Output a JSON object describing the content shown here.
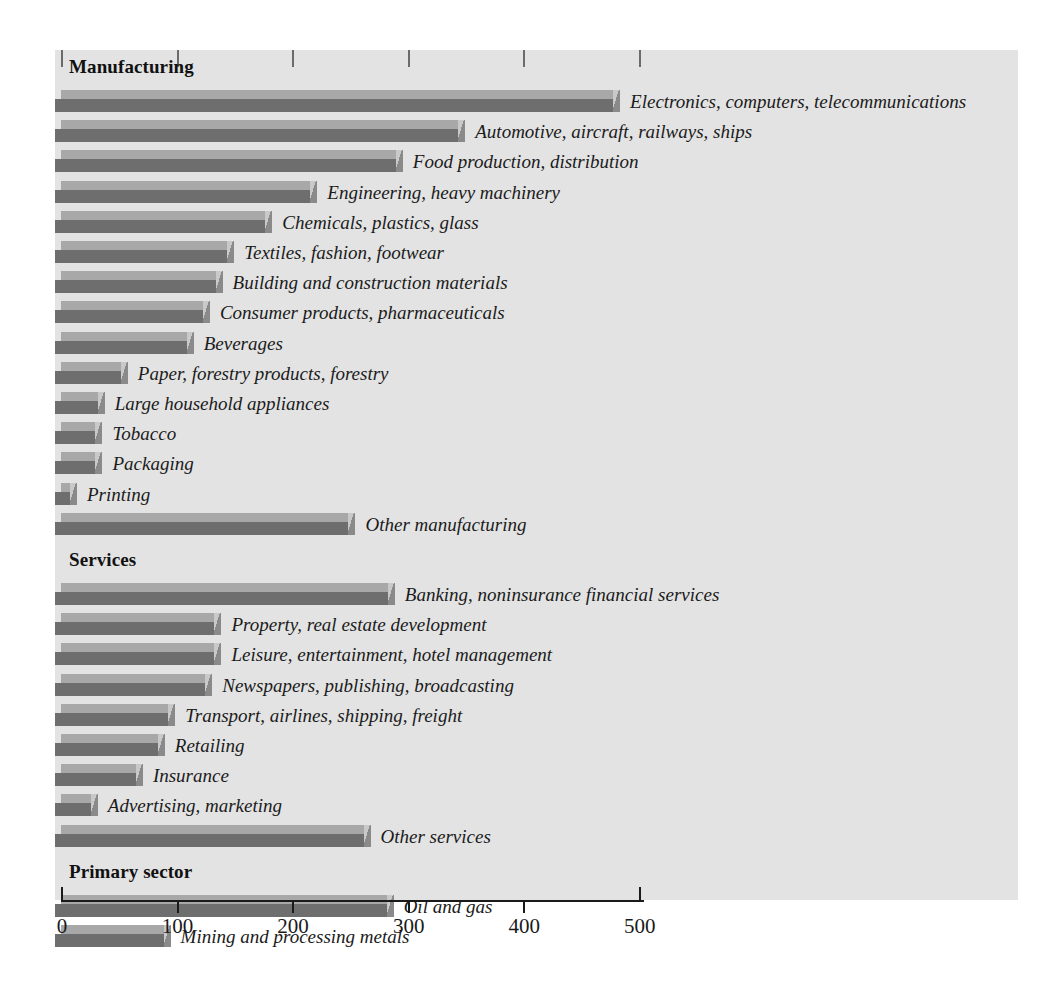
{
  "chart_data": {
    "type": "bar",
    "orientation": "horizontal",
    "title": "",
    "xlabel": "",
    "ylabel": "",
    "xlim": [
      0,
      500
    ],
    "xticks": [
      0,
      100,
      200,
      300,
      400,
      500
    ],
    "xtick_labels": [
      "0",
      "100",
      "200",
      "300",
      "400",
      "500"
    ],
    "grid": false,
    "legend": "none",
    "groups": [
      {
        "name": "Manufacturing",
        "categories": [
          "Electronics, computers, telecommunications",
          "Automotive, aircraft, railways, ships",
          "Food production, distribution",
          "Engineering, heavy machinery",
          "Chemicals, plastics, glass",
          "Textiles, fashion, footwear",
          "Building and construction materials",
          "Consumer products, pharmaceuticals",
          "Beverages",
          "Paper, forestry products, forestry",
          "Large household appliances",
          "Tobacco",
          "Packaging",
          "Printing",
          "Other manufacturing"
        ],
        "values": [
          483,
          349,
          295,
          221,
          182,
          149,
          139,
          128,
          114,
          57,
          37,
          35,
          35,
          13,
          254
        ]
      },
      {
        "name": "Services",
        "categories": [
          "Banking, noninsurance financial services",
          "Property, real estate development",
          "Leisure, entertainment, hotel management",
          "Newspapers, publishing, broadcasting",
          "Transport, airlines, shipping, freight",
          "Retailing",
          "Insurance",
          "Advertising, marketing",
          "Other services"
        ],
        "values": [
          288,
          138,
          138,
          130,
          98,
          89,
          70,
          31,
          267
        ]
      },
      {
        "name": "Primary sector",
        "categories": [
          "Oil and gas",
          "Mining and processing metals"
        ],
        "values": [
          287,
          94
        ]
      }
    ]
  },
  "colors": {
    "plot_background": "#e3e3e3",
    "bar_top": "#a8a8a8",
    "bar_body": "#6e6e6e",
    "bar_cap": "#c9c9c9",
    "axis": "#1a1a1a",
    "text": "#1b1b1b"
  }
}
